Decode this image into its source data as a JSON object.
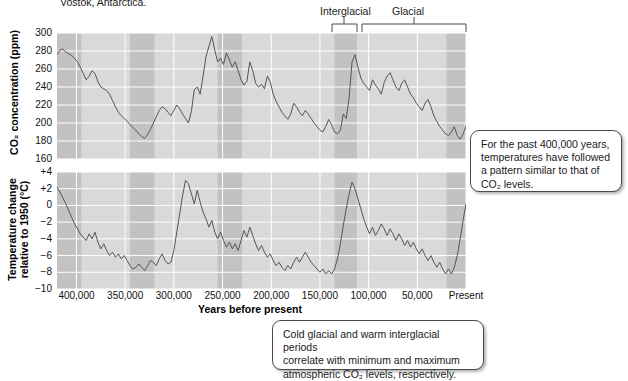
{
  "figure": {
    "caption_fragment": "Vostok, Antarctica.",
    "period_labels": {
      "interglacial": "Interglacial",
      "glacial": "Glacial"
    }
  },
  "callouts": {
    "right": "For the past 400,000 years, temperatures have followed a pattern similar to that of CO₂ levels.",
    "right_lines": [
      "For the past 400,000 years,",
      "temperatures have followed",
      "a pattern similar to that of",
      "CO₂ levels."
    ],
    "bottom": "Cold glacial and warm interglacial periods correlate with minimum and maximum atmospheric CO₂ levels, respectively.",
    "bottom_lines": [
      "Cold glacial and warm interglacial periods",
      "correlate with minimum and maximum",
      "atmospheric CO₂ levels, respectively."
    ]
  },
  "colors": {
    "plot_background": "#d9d9d9",
    "band_shade": "#c2c2c2",
    "gridline": "#ffffff",
    "data_line": "#555555",
    "text": "#1a1a1a"
  },
  "chart_data": [
    {
      "type": "line",
      "id": "co2",
      "title": "",
      "xlabel": "Years before present",
      "ylabel": "CO2 concentration (ppm)",
      "ylabel_display": "CO₂ concentration (ppm)",
      "ylim": [
        160,
        300
      ],
      "yticks": [
        300,
        280,
        260,
        240,
        220,
        200,
        180,
        160
      ],
      "ytick_labels": [
        "300",
        "280",
        "260",
        "240",
        "220",
        "200",
        "180",
        "160"
      ],
      "xlim": [
        420000,
        0
      ],
      "xticks": [
        400000,
        350000,
        300000,
        250000,
        200000,
        150000,
        100000,
        50000,
        0
      ],
      "xtick_labels": [
        "400,000",
        "350,000",
        "300,000",
        "250,000",
        "200,000",
        "150,000",
        "100,000",
        "50,000",
        "Present"
      ],
      "grid": true,
      "legend": "none",
      "x": [
        420000,
        417000,
        414000,
        411000,
        408000,
        405000,
        402000,
        399000,
        396000,
        393000,
        390000,
        387000,
        384000,
        381000,
        378000,
        375000,
        372000,
        369000,
        366000,
        363000,
        360000,
        357000,
        354000,
        351000,
        348000,
        345000,
        342000,
        339000,
        336000,
        333000,
        330000,
        327000,
        324000,
        321000,
        318000,
        315000,
        312000,
        309000,
        306000,
        303000,
        300000,
        297000,
        294000,
        291000,
        288000,
        285000,
        282000,
        279000,
        276000,
        273000,
        270000,
        267000,
        264000,
        261000,
        258000,
        255000,
        252000,
        249000,
        246000,
        243000,
        240000,
        237000,
        234000,
        231000,
        228000,
        225000,
        222000,
        219000,
        216000,
        213000,
        210000,
        207000,
        204000,
        201000,
        198000,
        195000,
        192000,
        189000,
        186000,
        183000,
        180000,
        177000,
        174000,
        171000,
        168000,
        165000,
        162000,
        159000,
        156000,
        153000,
        150000,
        147000,
        144000,
        141000,
        138000,
        135000,
        132000,
        129000,
        126000,
        123000,
        120000,
        117000,
        114000,
        111000,
        108000,
        105000,
        102000,
        99000,
        96000,
        93000,
        90000,
        87000,
        84000,
        81000,
        78000,
        75000,
        72000,
        69000,
        66000,
        63000,
        60000,
        57000,
        54000,
        51000,
        48000,
        45000,
        42000,
        39000,
        36000,
        33000,
        30000,
        27000,
        24000,
        21000,
        18000,
        15000,
        12000,
        9000,
        6000,
        3000,
        0
      ],
      "y": [
        276,
        281,
        282,
        279,
        277,
        275,
        272,
        268,
        262,
        255,
        248,
        252,
        258,
        255,
        246,
        240,
        238,
        236,
        232,
        225,
        218,
        212,
        208,
        205,
        202,
        198,
        195,
        192,
        188,
        185,
        183,
        187,
        193,
        200,
        207,
        214,
        218,
        216,
        212,
        208,
        214,
        220,
        216,
        210,
        205,
        200,
        213,
        237,
        240,
        232,
        252,
        274,
        285,
        296,
        281,
        268,
        272,
        265,
        278,
        270,
        262,
        268,
        258,
        248,
        242,
        246,
        268,
        258,
        244,
        240,
        243,
        238,
        252,
        246,
        232,
        224,
        218,
        212,
        208,
        204,
        210,
        222,
        218,
        212,
        208,
        214,
        210,
        205,
        200,
        196,
        192,
        190,
        196,
        204,
        198,
        190,
        188,
        192,
        210,
        205,
        228,
        268,
        276,
        262,
        250,
        244,
        240,
        236,
        248,
        242,
        238,
        232,
        245,
        252,
        256,
        248,
        240,
        236,
        244,
        248,
        240,
        232,
        228,
        222,
        218,
        214,
        222,
        226,
        218,
        208,
        202,
        196,
        192,
        188,
        186,
        190,
        196,
        186,
        182,
        188,
        196,
        204,
        218,
        240,
        262,
        284
      ]
    },
    {
      "type": "line",
      "id": "temperature",
      "title": "",
      "xlabel": "Years before present",
      "ylabel": "Temperature change relative to 1950 (°C)",
      "ylabel_line1": "Temperature change",
      "ylabel_line2": "relative to 1950 (°C)",
      "ylim": [
        -10,
        4
      ],
      "yticks": [
        4,
        2,
        0,
        -2,
        -4,
        -6,
        -8,
        -10
      ],
      "ytick_labels": [
        "+4",
        "+2",
        "0",
        "−2",
        "−4",
        "−6",
        "−8",
        "−10"
      ],
      "xlim": [
        420000,
        0
      ],
      "xticks": [
        400000,
        350000,
        300000,
        250000,
        200000,
        150000,
        100000,
        50000,
        0
      ],
      "xtick_labels": [
        "400,000",
        "350,000",
        "300,000",
        "250,000",
        "200,000",
        "150,000",
        "100,000",
        "50,000",
        "Present"
      ],
      "grid": true,
      "legend": "none",
      "x": [
        420000,
        417000,
        414000,
        411000,
        408000,
        405000,
        402000,
        399000,
        396000,
        393000,
        390000,
        387000,
        384000,
        381000,
        378000,
        375000,
        372000,
        369000,
        366000,
        363000,
        360000,
        357000,
        354000,
        351000,
        348000,
        345000,
        342000,
        339000,
        336000,
        333000,
        330000,
        327000,
        324000,
        321000,
        318000,
        315000,
        312000,
        309000,
        306000,
        303000,
        300000,
        297000,
        294000,
        291000,
        288000,
        285000,
        282000,
        279000,
        276000,
        273000,
        270000,
        267000,
        264000,
        261000,
        258000,
        255000,
        252000,
        249000,
        246000,
        243000,
        240000,
        237000,
        234000,
        231000,
        228000,
        225000,
        222000,
        219000,
        216000,
        213000,
        210000,
        207000,
        204000,
        201000,
        198000,
        195000,
        192000,
        189000,
        186000,
        183000,
        180000,
        177000,
        174000,
        171000,
        168000,
        165000,
        162000,
        159000,
        156000,
        153000,
        150000,
        147000,
        144000,
        141000,
        138000,
        135000,
        132000,
        129000,
        126000,
        123000,
        120000,
        117000,
        114000,
        111000,
        108000,
        105000,
        102000,
        99000,
        96000,
        93000,
        90000,
        87000,
        84000,
        81000,
        78000,
        75000,
        72000,
        69000,
        66000,
        63000,
        60000,
        57000,
        54000,
        51000,
        48000,
        45000,
        42000,
        39000,
        36000,
        33000,
        30000,
        27000,
        24000,
        21000,
        18000,
        15000,
        12000,
        9000,
        6000,
        3000,
        0
      ],
      "y": [
        2.2,
        1.6,
        0.9,
        0.2,
        -0.6,
        -1.4,
        -2.2,
        -2.8,
        -3.4,
        -3.8,
        -4.2,
        -3.4,
        -4.0,
        -3.2,
        -4.4,
        -5.2,
        -4.6,
        -5.4,
        -6.0,
        -5.6,
        -6.2,
        -5.8,
        -6.4,
        -6.0,
        -6.6,
        -7.2,
        -7.6,
        -7.4,
        -7.0,
        -7.4,
        -7.8,
        -7.2,
        -6.6,
        -6.8,
        -7.2,
        -6.4,
        -5.8,
        -6.6,
        -7.0,
        -6.8,
        -5.4,
        -3.2,
        -1.0,
        1.2,
        3.0,
        2.6,
        1.4,
        0.2,
        1.8,
        0.4,
        -0.8,
        -1.6,
        -2.6,
        -1.8,
        -3.2,
        -4.0,
        -3.2,
        -4.2,
        -5.0,
        -4.4,
        -5.2,
        -4.6,
        -5.4,
        -4.2,
        -3.0,
        -3.8,
        -2.6,
        -3.6,
        -4.6,
        -5.4,
        -4.8,
        -5.6,
        -6.2,
        -5.8,
        -6.6,
        -7.2,
        -6.8,
        -7.4,
        -7.8,
        -7.2,
        -7.6,
        -6.8,
        -6.2,
        -6.8,
        -6.2,
        -5.6,
        -6.2,
        -6.8,
        -7.2,
        -7.6,
        -8.0,
        -7.6,
        -8.2,
        -7.8,
        -8.2,
        -7.6,
        -6.4,
        -4.6,
        -2.4,
        -0.4,
        1.4,
        2.8,
        2.0,
        0.8,
        -0.4,
        -1.6,
        -2.6,
        -3.4,
        -2.6,
        -3.6,
        -3.0,
        -2.2,
        -2.8,
        -3.6,
        -2.8,
        -3.4,
        -4.2,
        -3.4,
        -4.0,
        -4.8,
        -4.2,
        -5.0,
        -4.4,
        -5.2,
        -5.8,
        -5.2,
        -6.0,
        -6.6,
        -6.0,
        -6.8,
        -7.4,
        -6.8,
        -7.6,
        -8.2,
        -7.6,
        -8.2,
        -7.4,
        -6.0,
        -4.0,
        -1.8,
        0.2,
        1.6,
        0.6
      ]
    }
  ],
  "shaded_bands": {
    "description": "Darker vertical bands mark interglacial periods",
    "ranges": [
      [
        420000,
        395000
      ],
      [
        345000,
        320000
      ],
      [
        255000,
        230000
      ],
      [
        135000,
        112000
      ],
      [
        20000,
        0
      ]
    ]
  },
  "brackets": {
    "interglacial": {
      "from_year": 135000,
      "to_year": 112000
    },
    "glacial": {
      "from_year": 112000,
      "to_year": 20000
    }
  }
}
